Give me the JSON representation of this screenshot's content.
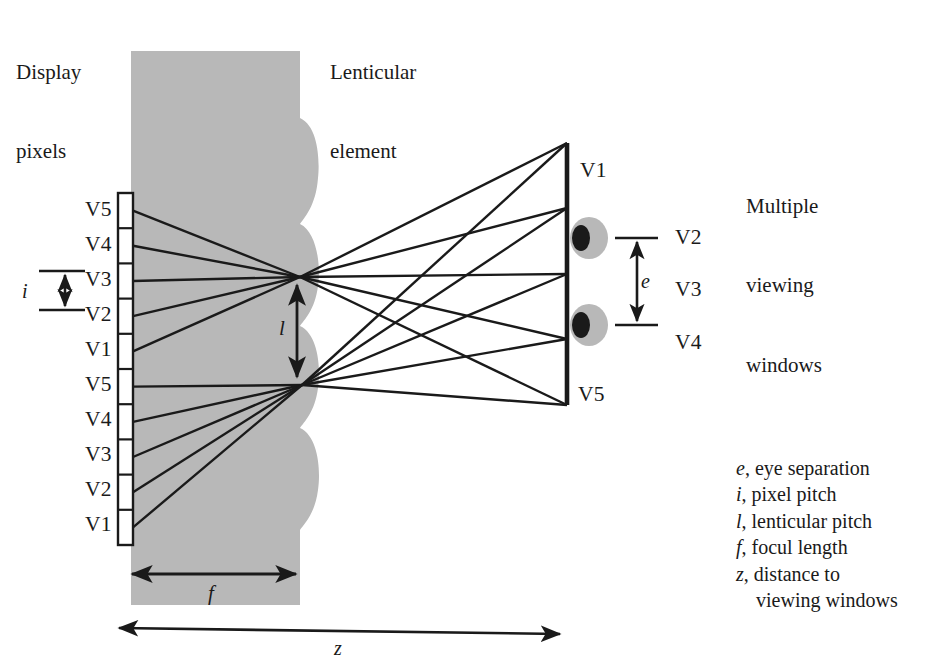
{
  "figure": {
    "type": "optical-ray-diagram",
    "background_color": "#ffffff",
    "ink_color": "#1a1a1a",
    "element_fill": "#b8b8b8"
  },
  "labels": {
    "display_pixels": "Display\npixels",
    "display_pixels_line1": "Display",
    "display_pixels_line2": "pixels",
    "lenticular_element_line1": "Lenticular",
    "lenticular_element_line2": "element",
    "viewing_windows_line1": "Multiple",
    "viewing_windows_line2": "viewing",
    "viewing_windows_line3": "windows"
  },
  "pixel_column": {
    "description": "Column of display pixels, repeating view order V5..V1 twice",
    "labels": [
      "V5",
      "V4",
      "V3",
      "V2",
      "V1",
      "V5",
      "V4",
      "V3",
      "V2",
      "V1"
    ],
    "cell_count": 10,
    "top_y": 193,
    "bottom_y": 545
  },
  "window_bar": {
    "description": "Vertical bar of viewing windows at viewing distance",
    "top_label": "V1",
    "bottom_label": "V5",
    "window_count": 5,
    "top_y": 143,
    "bottom_y": 405,
    "x": 567
  },
  "window_side_labels": [
    {
      "text": "V2",
      "y": 236
    },
    {
      "text": "V3",
      "y": 288
    },
    {
      "text": "V4",
      "y": 341
    }
  ],
  "eyes": [
    {
      "name": "left-eye",
      "cx": 589,
      "cy": 238
    },
    {
      "name": "right-eye",
      "cx": 589,
      "cy": 325
    }
  ],
  "dimensions": {
    "i": {
      "symbol": "i",
      "meaning": "pixel pitch"
    },
    "l": {
      "symbol": "l",
      "meaning": "lenticular pitch"
    },
    "e": {
      "symbol": "e",
      "meaning": "eye separation"
    },
    "f": {
      "symbol": "f",
      "meaning": "focul length"
    },
    "z": {
      "symbol": "z",
      "meaning": "distance to viewing windows"
    }
  },
  "legend": {
    "items": [
      {
        "symbol": "e",
        "separator": ", ",
        "text": "eye separation"
      },
      {
        "symbol": "i",
        "separator": ", ",
        "text": "pixel pitch"
      },
      {
        "symbol": "l",
        "separator": ", ",
        "text": "lenticular pitch"
      },
      {
        "symbol": "f",
        "separator": ", ",
        "text": "focul length"
      },
      {
        "symbol": "z",
        "separator": ", ",
        "text": "distance to"
      }
    ],
    "continuation": "viewing windows"
  },
  "lens_nodes": [
    {
      "name": "upper-lens-node",
      "x": 300,
      "y": 277
    },
    {
      "name": "lower-lens-node",
      "x": 302,
      "y": 385
    }
  ]
}
